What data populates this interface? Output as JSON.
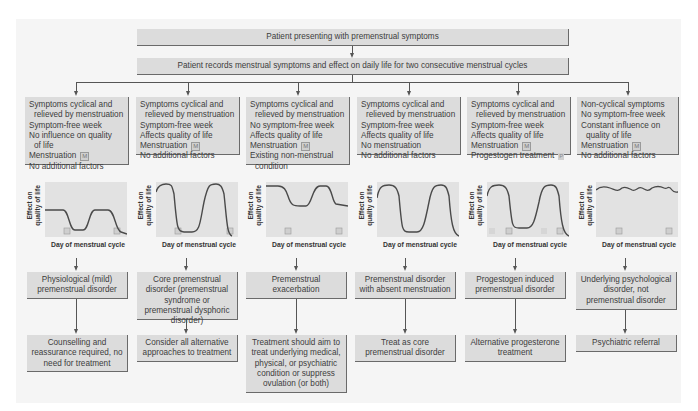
{
  "top": {
    "presenting": "Patient presenting with premenstrual symptoms",
    "records": "Patient records menstrual symptoms and effect on daily life for two consecutive menstrual cycles"
  },
  "chart_axes": {
    "ylabel_line1": "Effect on",
    "ylabel_line2": "quality of life",
    "xlabel": "Day of menstrual cycle",
    "menstruation_marker": "M",
    "progestogen_marker": "P"
  },
  "columns": [
    {
      "criteria": [
        "Symptoms cyclical and",
        "relieved by menstruation",
        "Symptom-free week",
        "No influence on quality",
        "of life",
        "Menstruation",
        "No additional factors"
      ],
      "chart": "mild",
      "diagnosis": "Physiological (mild) premenstrual disorder",
      "action": "Counselling and reassurance required, no need for treatment"
    },
    {
      "criteria": [
        "Symptoms cyclical and",
        "relieved by menstruation",
        "Symptom-free week",
        "Affects quality of life",
        "Menstruation",
        "No additional factors"
      ],
      "chart": "core",
      "diagnosis": "Core premenstrual disorder (premenstrual syndrome or premenstrual dysphoric disorder)",
      "action": "Consider all alternative approaches to treatment"
    },
    {
      "criteria": [
        "Symptoms cyclical and",
        "relieved by menstruation",
        "No symptom-free week",
        "Affects quality of life",
        "Menstruation",
        "Existing non-menstrual",
        "condition"
      ],
      "chart": "exacerbation",
      "diagnosis": "Premenstrual exacerbation",
      "action": "Treatment should aim to treat underlying medical, physical, or psychiatric condition or suppress ovulation (or both)"
    },
    {
      "criteria": [
        "Symptoms cyclical and",
        "relieved by menstruation",
        "Symptom-free week",
        "Affects quality of life",
        "No menstruation",
        "No additional factors"
      ],
      "chart": "absent",
      "diagnosis": "Premenstrual disorder with absent menstruation",
      "action": "Treat as core premenstrual disorder"
    },
    {
      "criteria": [
        "Symptoms cyclical and",
        "relieved by menstruation",
        "Symptom-free week",
        "Affects quality of life",
        "Menstruation",
        "Progestogen treatment"
      ],
      "chart": "progestogen",
      "diagnosis": "Progestogen induced premenstrual disorder",
      "action": "Alternative progesterone treatment"
    },
    {
      "criteria": [
        "Non-cyclical symptoms",
        "No symptom-free week",
        "Constant influence on",
        "quality of life",
        "Menstruation",
        "No additional factors"
      ],
      "chart": "flat",
      "diagnosis": "Underlying psychological disorder, not premenstrual disorder",
      "action": "Psychiatric referral"
    }
  ],
  "colors": {
    "box_fill": "#dcdcdc",
    "box_shadow": "#6a6a6a",
    "panel": "#f5f5f5",
    "curve": "#4a4a4a",
    "chart_bg": "#e2e2e2"
  }
}
